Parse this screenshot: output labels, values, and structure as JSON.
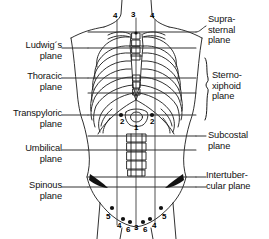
{
  "figure": {
    "type": "anatomical-diagram",
    "background": "#ffffff",
    "line_color": "#1a1a1a",
    "fill_color": "#111111"
  },
  "labels_left": [
    {
      "name": "ludwigs-plane",
      "text": "Ludwig´s\nplane",
      "x": 8,
      "y": 40,
      "w": 78,
      "line_y": 48,
      "line_x1": 88,
      "line_x2": 196
    },
    {
      "name": "thoracic-plane",
      "text": "Thoracic\nplane",
      "x": 8,
      "y": 71,
      "w": 78,
      "line_y": 78,
      "line_x1": 88,
      "line_x2": 196
    },
    {
      "name": "transpyloric-plane",
      "text": "Transpyloric\nplane",
      "x": 2,
      "y": 108,
      "w": 84,
      "line_y": 115,
      "line_x1": 88,
      "line_x2": 196
    },
    {
      "name": "umbilical-plane",
      "text": "Umbilical\nplane",
      "x": 8,
      "y": 143,
      "w": 78,
      "line_y": 150,
      "line_x1": 88,
      "line_x2": 196
    },
    {
      "name": "spinous-plane",
      "text": "Spinous\nplane",
      "x": 8,
      "y": 180,
      "w": 78,
      "line_y": 187,
      "line_x1": 88,
      "line_x2": 196
    }
  ],
  "labels_right": [
    {
      "name": "suprasternal-plane",
      "text": "Supra-\nsternal\nplane",
      "x": 202,
      "y": 14,
      "w": 66
    },
    {
      "name": "sternoxiphoid-plane",
      "text": "Sterno-\nxiphoid\nplane",
      "x": 210,
      "y": 70,
      "w": 58
    },
    {
      "name": "subcostal-plane",
      "text": "Subcostal\nplane",
      "x": 202,
      "y": 130,
      "w": 66
    },
    {
      "name": "intertubercular-plane",
      "text": "Intertuber-\ncular plane",
      "x": 202,
      "y": 170,
      "w": 66
    }
  ],
  "markers": {
    "top": [
      {
        "value": "4",
        "x": 119,
        "y": 16
      },
      {
        "value": "3",
        "x": 133,
        "y": 15
      },
      {
        "value": "4",
        "x": 150,
        "y": 16
      }
    ],
    "middle": [
      {
        "value": "2",
        "x": 123,
        "y": 120
      },
      {
        "value": "1",
        "x": 137,
        "y": 126
      },
      {
        "value": "2",
        "x": 151,
        "y": 120
      }
    ],
    "bottom": [
      {
        "value": "5",
        "x": 109,
        "y": 216
      },
      {
        "value": "4",
        "x": 119,
        "y": 224
      },
      {
        "value": "6",
        "x": 127,
        "y": 228
      },
      {
        "value": "3",
        "x": 136,
        "y": 226
      },
      {
        "value": "6",
        "x": 145,
        "y": 228
      },
      {
        "value": "4",
        "x": 154,
        "y": 224
      },
      {
        "value": "5",
        "x": 163,
        "y": 216
      }
    ]
  },
  "planes": {
    "y_suprasternal": 32,
    "y_ludwig": 48,
    "y_thoracic": 78,
    "y_sternoxiphoid": 93,
    "y_transpyloric": 115,
    "y_subcostal": 136,
    "y_umbilical": 150,
    "y_intertubercular": 177,
    "y_spinous": 187
  },
  "vertical_lines": {
    "x_left_midclavicular": 117,
    "x_median": 136,
    "x_right_midclavicular": 155
  }
}
